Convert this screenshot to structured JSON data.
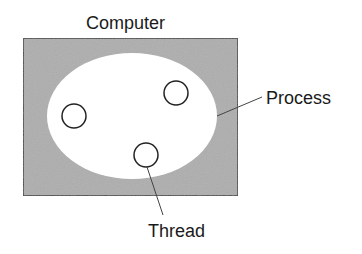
{
  "diagram": {
    "title": "Computer",
    "labels": {
      "computer": "Computer",
      "process": "Process",
      "thread": "Thread"
    },
    "colors": {
      "background": "#ffffff",
      "computer_fill": "#a9a9a9",
      "computer_stroke": "#222222",
      "process_fill": "#ffffff",
      "thread_stroke": "#222222",
      "text": "#1a1a1a",
      "leader_line": "#444444"
    },
    "shapes": {
      "computer_box": {
        "x": 23,
        "y": 38,
        "width": 215,
        "height": 158
      },
      "process_ellipse": {
        "cx": 132,
        "cy": 116,
        "rx": 85,
        "ry": 63
      },
      "threads": [
        {
          "cx": 74,
          "cy": 116,
          "r": 12
        },
        {
          "cx": 176,
          "cy": 93,
          "r": 12
        },
        {
          "cx": 146,
          "cy": 155,
          "r": 12
        }
      ]
    },
    "leaders": {
      "process": {
        "x1": 262,
        "y1": 97,
        "x2": 217,
        "y2": 116
      },
      "thread": {
        "x1": 147,
        "y1": 167,
        "x2": 163,
        "y2": 215
      }
    }
  }
}
